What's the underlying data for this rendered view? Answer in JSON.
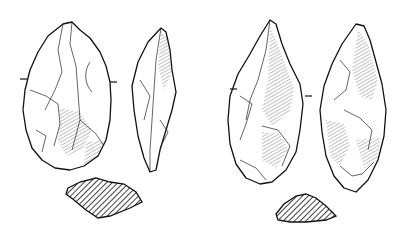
{
  "figure": {
    "colors": {
      "ink": "#111111",
      "background": "#ffffff"
    },
    "artifacts": [
      {
        "id": "handaxe-1",
        "views": [
          "face",
          "profile",
          "cross-section"
        ]
      },
      {
        "id": "handaxe-2",
        "views": [
          "face",
          "profile",
          "cross-section"
        ]
      }
    ]
  }
}
